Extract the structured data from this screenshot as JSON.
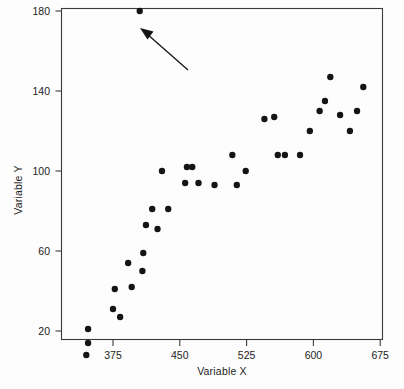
{
  "chart_data": {
    "type": "scatter",
    "title": "",
    "xlabel": "Variable X",
    "ylabel": "Variable Y",
    "xlim": [
      337,
      678
    ],
    "ylim": [
      16,
      184
    ],
    "xticks": [
      375,
      450,
      525,
      600,
      675
    ],
    "yticks": [
      20,
      60,
      100,
      140,
      180
    ],
    "xtick_labels": [
      "375",
      "450",
      "525",
      "600",
      "675"
    ],
    "ytick_labels": [
      "20",
      "60",
      "100",
      "140",
      "180"
    ],
    "grid": false,
    "legend": null,
    "marker": {
      "shape": "circle",
      "color": "#141414",
      "size": 4.6
    },
    "series": [
      {
        "name": "observations",
        "points": [
          [
            358,
            160
          ],
          [
            358,
            153
          ],
          [
            356,
            146
          ],
          [
            388,
            155
          ],
          [
            387,
            145
          ],
          [
            404,
            169
          ],
          [
            407,
            157
          ],
          [
            395,
            141
          ],
          [
            420,
            125
          ],
          [
            419,
            116
          ],
          [
            423,
            109
          ],
          [
            430,
            104
          ],
          [
            436,
            108
          ],
          [
            441,
            121
          ],
          [
            448,
            134
          ],
          [
            450,
            100
          ],
          [
            459,
            121
          ],
          [
            478,
            174
          ],
          [
            482,
            175
          ],
          [
            496,
            160
          ],
          [
            520,
            160
          ],
          [
            514,
            145
          ],
          [
            529,
            172
          ],
          [
            550,
            146
          ],
          [
            561,
            153
          ],
          [
            565,
            175
          ],
          [
            573,
            172
          ],
          [
            590,
            175
          ],
          [
            600,
            172
          ],
          [
            611,
            163
          ],
          [
            617,
            159
          ],
          [
            623,
            166
          ],
          [
            634,
            155
          ],
          [
            645,
            180
          ],
          [
            653,
            154
          ],
          [
            659,
            171
          ],
          [
            661,
            145
          ]
        ]
      }
    ],
    "points_data": [
      {
        "x": 347,
        "y": 21
      },
      {
        "x": 347,
        "y": 14
      },
      {
        "x": 345,
        "y": 8
      },
      {
        "x": 377,
        "y": 41
      },
      {
        "x": 375,
        "y": 31
      },
      {
        "x": 392,
        "y": 54
      },
      {
        "x": 396,
        "y": 42
      },
      {
        "x": 383,
        "y": 27
      },
      {
        "x": 409,
        "y": 59
      },
      {
        "x": 408,
        "y": 50
      },
      {
        "x": 412,
        "y": 73
      },
      {
        "x": 419,
        "y": 81
      },
      {
        "x": 425,
        "y": 71
      },
      {
        "x": 430,
        "y": 100
      },
      {
        "x": 437,
        "y": 81
      },
      {
        "x": 456,
        "y": 94
      },
      {
        "x": 458,
        "y": 102
      },
      {
        "x": 464,
        "y": 102
      },
      {
        "x": 471,
        "y": 94
      },
      {
        "x": 489,
        "y": 93
      },
      {
        "x": 514,
        "y": 93
      },
      {
        "x": 509,
        "y": 108
      },
      {
        "x": 524,
        "y": 100
      },
      {
        "x": 545,
        "y": 126
      },
      {
        "x": 556,
        "y": 127
      },
      {
        "x": 560,
        "y": 108
      },
      {
        "x": 568,
        "y": 108
      },
      {
        "x": 585,
        "y": 108
      },
      {
        "x": 596,
        "y": 120
      },
      {
        "x": 607,
        "y": 130
      },
      {
        "x": 613,
        "y": 135
      },
      {
        "x": 619,
        "y": 147
      },
      {
        "x": 630,
        "y": 128
      },
      {
        "x": 641,
        "y": 120
      },
      {
        "x": 649,
        "y": 130
      },
      {
        "x": 656,
        "y": 142
      },
      {
        "x": 405,
        "y": 180
      }
    ],
    "annotations": [
      {
        "type": "arrow",
        "label": "",
        "points_to": {
          "x": 405,
          "y": 180
        },
        "description": "arrow pointing up-left at the high outlier"
      }
    ]
  },
  "figure": {
    "background_color": "#fdfdfd",
    "frame_color": "#3a3a3a",
    "text_color": "#222222"
  }
}
